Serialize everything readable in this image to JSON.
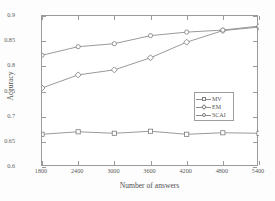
{
  "chart_data": {
    "type": "line",
    "title": "",
    "xlabel": "Number of answers",
    "ylabel": "Accuracy",
    "x": [
      1800,
      2400,
      3000,
      3600,
      4200,
      4800,
      5400
    ],
    "xticklabels": [
      "1800",
      "2400",
      "3000",
      "3600",
      "4200",
      "4800",
      "5400"
    ],
    "yticklabels": [
      "0.6",
      "0.65",
      "0.7",
      "0.75",
      "0.8",
      "0.85",
      "0.9"
    ],
    "yticks": [
      0.6,
      0.65,
      0.7,
      0.75,
      0.8,
      0.85,
      0.9
    ],
    "xlim": [
      1800,
      5400
    ],
    "ylim": [
      0.6,
      0.9
    ],
    "grid": false,
    "legend_position": "center-right",
    "series": [
      {
        "name": "MV",
        "marker": "square",
        "color": "#8e8e8e",
        "values": [
          0.665,
          0.67,
          0.667,
          0.671,
          0.665,
          0.668,
          0.667
        ]
      },
      {
        "name": "EM",
        "marker": "diamond",
        "color": "#8e8e8e",
        "values": [
          0.757,
          0.783,
          0.793,
          0.817,
          0.848,
          0.871,
          0.878
        ]
      },
      {
        "name": "SCAI",
        "marker": "circle",
        "color": "#8e8e8e",
        "values": [
          0.822,
          0.839,
          0.845,
          0.861,
          0.868,
          0.872,
          0.88
        ]
      }
    ]
  },
  "axes": {
    "x_title": "Number of answers",
    "y_title": "Accuracy"
  },
  "legend": {
    "items": [
      {
        "label": "MV"
      },
      {
        "label": "EM"
      },
      {
        "label": "SCAI"
      }
    ]
  }
}
